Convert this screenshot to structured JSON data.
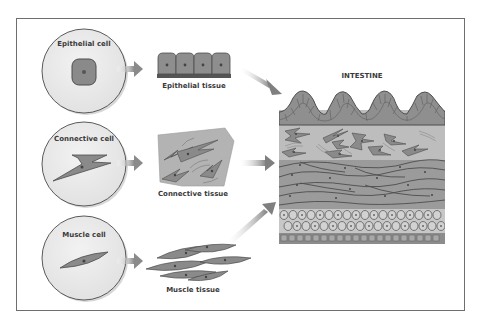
{
  "diagram": {
    "title": "INTESTINE",
    "colors": {
      "background": "#ffffff",
      "frame": "#6e6e6e",
      "cell_circle_fill": "#e9e9e9",
      "cell_circle_stroke": "#5a5a5a",
      "cell_fill": "#8a8a8a",
      "cell_stroke": "#4d4d4d",
      "connective_bg": "#b3b3b3",
      "arrow": "#9a9a9a",
      "intestine_epithelium": "#8f8f8f",
      "intestine_connective": "#bdbdbd",
      "intestine_muscle": "#9b9b9b",
      "intestine_round_cells": "#c7c7c7",
      "intestine_base": "#8c8c8c"
    },
    "rows": [
      {
        "id": "epithelial",
        "cell_label": "Epithelial cell",
        "tissue_label": "Epithelial tissue"
      },
      {
        "id": "connective",
        "cell_label": "Connective cell",
        "tissue_label": "Connective tissue"
      },
      {
        "id": "muscle",
        "cell_label": "Muscle cell",
        "tissue_label": "Muscle tissue"
      }
    ],
    "flow": [
      {
        "from": "Epithelial cell",
        "to": "Epithelial tissue"
      },
      {
        "from": "Connective cell",
        "to": "Connective tissue"
      },
      {
        "from": "Muscle cell",
        "to": "Muscle tissue"
      },
      {
        "from": "Epithelial tissue",
        "to": "INTESTINE"
      },
      {
        "from": "Connective tissue",
        "to": "INTESTINE"
      },
      {
        "from": "Muscle tissue",
        "to": "INTESTINE"
      }
    ],
    "intestine_layers": [
      "villi epithelium",
      "connective tissue",
      "smooth muscle",
      "round cell layer",
      "base layer"
    ]
  }
}
